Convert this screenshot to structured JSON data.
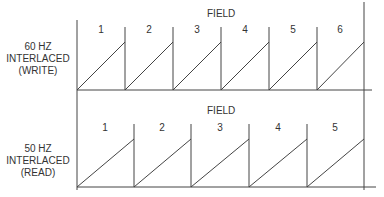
{
  "rows": [
    {
      "id": "write",
      "label_lines": [
        "60 HZ",
        "INTERLACED",
        "(WRITE)"
      ],
      "field_title": "FIELD",
      "fields": [
        "1",
        "2",
        "3",
        "4",
        "5",
        "6"
      ]
    },
    {
      "id": "read",
      "label_lines": [
        "50 HZ",
        "INTERLACED",
        "(READ)"
      ],
      "field_title": "FIELD",
      "fields": [
        "1",
        "2",
        "3",
        "4",
        "5"
      ]
    }
  ]
}
